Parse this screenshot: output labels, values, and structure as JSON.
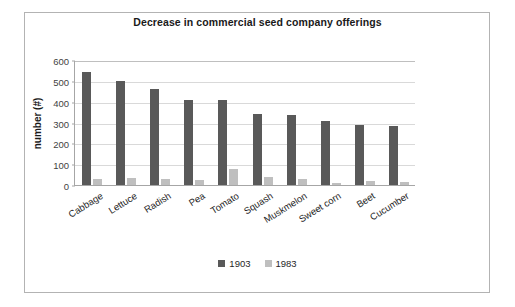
{
  "chart_data": {
    "type": "bar",
    "title": "Decrease in commercial seed company offerings",
    "xlabel": "",
    "ylabel": "number (#)",
    "ylim": [
      0,
      600
    ],
    "ytick_labels": [
      "600",
      "500",
      "400",
      "300",
      "200",
      "100",
      "0"
    ],
    "yticks": [
      600,
      500,
      400,
      300,
      200,
      100,
      0
    ],
    "grid": true,
    "legend_position": "bottom",
    "categories": [
      "Cabbage",
      "Lettuce",
      "Radish",
      "Pea",
      "Tomato",
      "Squash",
      "Muskmelon",
      "Sweet corn",
      "Beet",
      "Cucumber"
    ],
    "series": [
      {
        "name": "1903",
        "color": "#595959",
        "values": [
          544,
          497,
          463,
          408,
          408,
          341,
          338,
          307,
          288,
          285
        ]
      },
      {
        "name": "1983",
        "color": "#bfbfbf",
        "values": [
          28,
          36,
          27,
          25,
          79,
          40,
          29,
          12,
          17,
          16
        ]
      }
    ]
  },
  "legend": {
    "items": [
      {
        "label": "1903",
        "color": "#595959"
      },
      {
        "label": "1983",
        "color": "#bfbfbf"
      }
    ]
  },
  "colors": {
    "series_1903": "#595959",
    "series_1983": "#bfbfbf",
    "gridline": "#d9d9d9",
    "axis": "#a6a6a6",
    "frame_border": "#b3b3b3",
    "text": "#262626"
  }
}
